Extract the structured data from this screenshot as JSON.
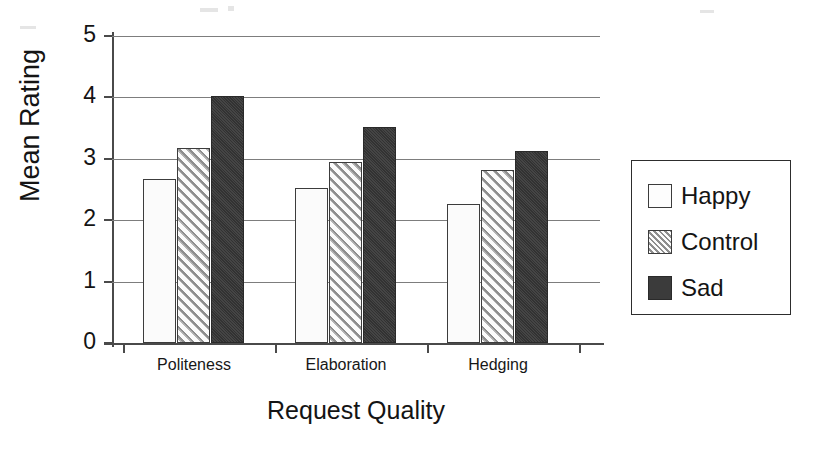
{
  "chart_data": {
    "type": "bar",
    "title": "",
    "xlabel": "Request Quality",
    "ylabel": "Mean Rating",
    "categories": [
      "Politeness",
      "Elaboration",
      "Hedging"
    ],
    "series": [
      {
        "name": "Happy",
        "values": [
          2.67,
          2.52,
          2.27
        ],
        "fill": "white",
        "color": "#fbfbfb"
      },
      {
        "name": "Control",
        "values": [
          3.17,
          2.95,
          2.81
        ],
        "fill": "diagonal-hatch",
        "color": "#b4b4b4"
      },
      {
        "name": "Sad",
        "values": [
          4.02,
          3.52,
          3.12
        ],
        "fill": "solid-dark",
        "color": "#3b3b3b"
      }
    ],
    "ylim": [
      0,
      5
    ],
    "ytick_labels": [
      "5",
      "4",
      "3",
      "2",
      "1",
      "0"
    ],
    "ytick_values": [
      5,
      4,
      3,
      2,
      1,
      0
    ],
    "grid": "horizontal",
    "legend_position": "right-outside",
    "legend_entries": [
      "Happy",
      "Control",
      "Sad"
    ]
  },
  "axes": {
    "y_title": "Mean Rating",
    "x_title": "Request Quality"
  },
  "legend": {
    "entries": [
      {
        "label": "Happy",
        "swatch": "white-square-icon"
      },
      {
        "label": "Control",
        "swatch": "hatched-square-icon"
      },
      {
        "label": "Sad",
        "swatch": "dark-square-icon"
      }
    ]
  }
}
